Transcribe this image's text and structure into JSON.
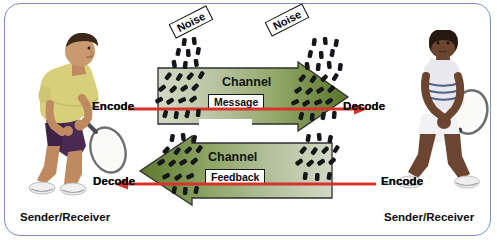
{
  "diagram": {
    "frame_border_color": "#7b93c4",
    "background": "#ffffff"
  },
  "actors": [
    {
      "id": "left",
      "role_label": "Sender/Receiver",
      "description": "male-tennis-player",
      "shirt_color": "#d8cf7a",
      "shorts_color": "#4a2a52",
      "skin_color": "#c89a6e"
    },
    {
      "id": "right",
      "role_label": "Sender/Receiver",
      "description": "female-tennis-player",
      "shirt_color": "#e8e8ee",
      "skirt_color": "#f2f2f4",
      "skin_color": "#6b4530"
    }
  ],
  "channels": [
    {
      "id": "upper",
      "label": "Channel",
      "payload_label": "Message",
      "direction": "left-to-right",
      "origin_label": "Encode",
      "destination_label": "Decode",
      "fill_start": "#cfd6c0",
      "fill_end": "#5c7a2e"
    },
    {
      "id": "lower",
      "label": "Channel",
      "payload_label": "Feedback",
      "direction": "right-to-left",
      "origin_label": "Encode",
      "destination_label": "Decode",
      "fill_start": "#cfd6c0",
      "fill_end": "#5c7a2e"
    }
  ],
  "noise": [
    {
      "id": "noise-left",
      "label": "Noise",
      "rotation_deg": -27
    },
    {
      "id": "noise-right",
      "label": "Noise",
      "rotation_deg": -27
    }
  ],
  "flow_color": "#d8322a",
  "labels": {
    "encode_top": "Encode",
    "decode_top": "Decode",
    "decode_bottom": "Decode",
    "encode_bottom": "Encode",
    "sender_receiver_left": "Sender/Receiver",
    "sender_receiver_right": "Sender/Receiver"
  }
}
